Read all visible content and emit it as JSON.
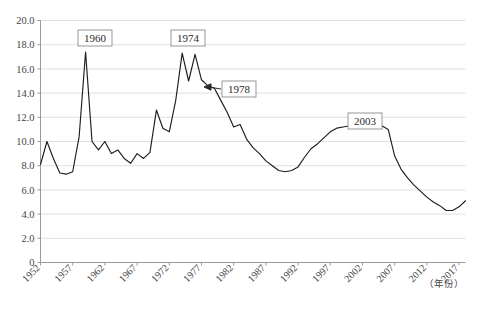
{
  "chart_data": {
    "type": "line",
    "title": "",
    "subtitle": "",
    "xlabel": "（年份）",
    "ylabel": "",
    "xlim": [
      1952,
      2018
    ],
    "ylim": [
      0,
      20
    ],
    "grid": true,
    "legend": false,
    "y_ticks": [
      "0",
      "2.0",
      "4.0",
      "6.0",
      "8.0",
      "10.0",
      "12.0",
      "14.0",
      "16.0",
      "18.0",
      "20.0"
    ],
    "y_tick_values": [
      0,
      2,
      4,
      6,
      8,
      10,
      12,
      14,
      16,
      18,
      20
    ],
    "x_ticks": [
      "1952",
      "1957",
      "1962",
      "1967",
      "1972",
      "1977",
      "1982",
      "1987",
      "1992",
      "1997",
      "2002",
      "2007",
      "2012",
      "2017"
    ],
    "x_tick_values": [
      1952,
      1957,
      1962,
      1967,
      1972,
      1977,
      1982,
      1987,
      1992,
      1997,
      2002,
      2007,
      2012,
      2017
    ],
    "x": [
      1952,
      1953,
      1954,
      1955,
      1956,
      1957,
      1958,
      1959,
      1960,
      1961,
      1962,
      1963,
      1964,
      1965,
      1966,
      1967,
      1968,
      1969,
      1970,
      1971,
      1972,
      1973,
      1974,
      1975,
      1976,
      1977,
      1978,
      1979,
      1980,
      1981,
      1982,
      1983,
      1984,
      1985,
      1986,
      1987,
      1988,
      1989,
      1990,
      1991,
      1992,
      1993,
      1994,
      1995,
      1996,
      1997,
      1998,
      1999,
      2000,
      2001,
      2002,
      2003,
      2004,
      2005,
      2006,
      2007,
      2008,
      2009,
      2010,
      2011,
      2012,
      2013,
      2014,
      2015,
      2016,
      2017,
      2018
    ],
    "values": [
      8.1,
      10.0,
      8.6,
      7.4,
      7.3,
      7.5,
      10.4,
      17.4,
      10.0,
      9.3,
      10.0,
      9.0,
      9.3,
      8.6,
      8.2,
      9.0,
      8.6,
      9.1,
      12.6,
      11.1,
      10.8,
      13.4,
      17.3,
      15.0,
      17.2,
      15.1,
      14.6,
      14.4,
      13.4,
      12.4,
      11.2,
      11.4,
      10.2,
      9.5,
      9.0,
      8.4,
      8.0,
      7.6,
      7.5,
      7.6,
      7.9,
      8.7,
      9.4,
      9.8,
      10.3,
      10.8,
      11.1,
      11.2,
      11.3,
      11.2,
      11.4,
      11.3,
      11.2,
      11.3,
      11.0,
      8.8,
      7.7,
      7.0,
      6.4,
      5.9,
      5.4,
      5.0,
      4.7,
      4.3,
      4.3,
      4.6,
      5.1
    ],
    "annotations": [
      {
        "label": "1960",
        "box_x": 78,
        "box_y": 30,
        "arrow": false
      },
      {
        "label": "1974",
        "box_x": 171,
        "box_y": 30,
        "arrow": false
      },
      {
        "label": "1978",
        "box_x": 222,
        "box_y": 81,
        "arrow": true,
        "arrow_to_x": 204,
        "arrow_to_y": 87
      },
      {
        "label": "2003",
        "box_x": 348,
        "box_y": 113,
        "arrow": false
      }
    ]
  },
  "colors": {
    "line": "#1d1d1d",
    "grid": "#d8d8d8",
    "axis": "#9a9a9a",
    "background": "#ffffff",
    "text": "#454545"
  }
}
